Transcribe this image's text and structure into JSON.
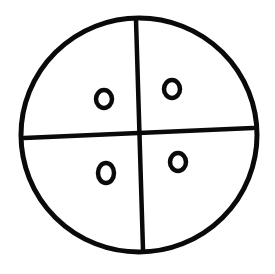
{
  "diagram": {
    "background": "#ffffff",
    "stroke_color": "#0a0a0a",
    "shapes": {
      "outer_circle": {
        "cx": 139,
        "cy": 135,
        "rx": 118,
        "ry": 117,
        "stroke_width": 5
      },
      "vertical_line": {
        "x1": 136,
        "y1": 20,
        "x2": 143,
        "y2": 250,
        "stroke_width": 4.5
      },
      "horizontal_line": {
        "x1": 24,
        "y1": 138,
        "x2": 253,
        "y2": 128,
        "stroke_width": 4.5
      },
      "rings": [
        {
          "name": "ring-top-left",
          "cx": 104,
          "cy": 99,
          "rx": 8,
          "ry": 9,
          "stroke_width": 4.5
        },
        {
          "name": "ring-top-right",
          "cx": 172,
          "cy": 89,
          "rx": 8,
          "ry": 9,
          "stroke_width": 4.5
        },
        {
          "name": "ring-bottom-left",
          "cx": 106,
          "cy": 173,
          "rx": 8,
          "ry": 10,
          "stroke_width": 4.5
        },
        {
          "name": "ring-bottom-right",
          "cx": 178,
          "cy": 162,
          "rx": 8,
          "ry": 9,
          "stroke_width": 4.5
        }
      ]
    }
  }
}
